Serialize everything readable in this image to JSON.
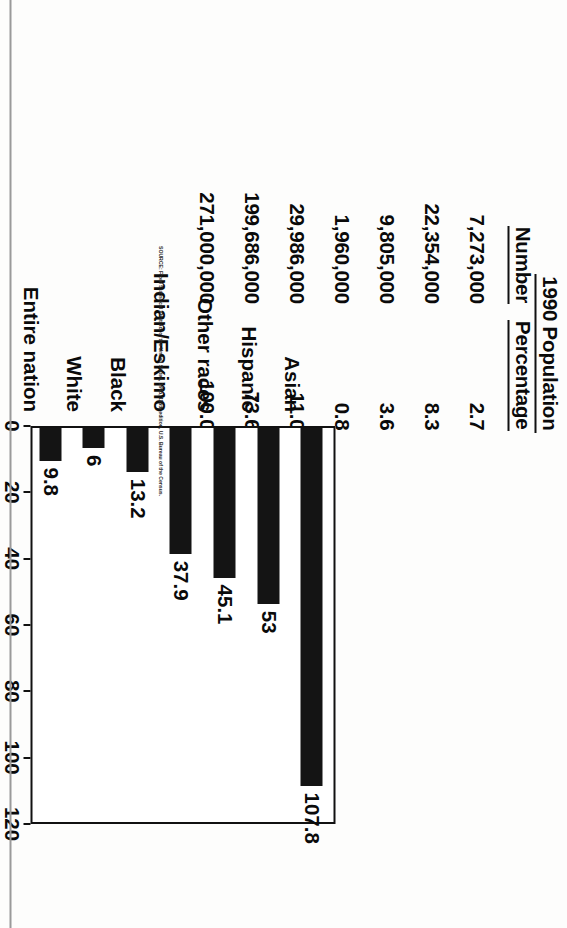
{
  "table": {
    "header_top": "1990 Population",
    "header_number": "Number",
    "header_percentage": "Percentage",
    "rows": [
      {
        "number": "7,273,000",
        "percentage": "2.7"
      },
      {
        "number": "22,354,000",
        "percentage": "8.3"
      },
      {
        "number": "9,805,000",
        "percentage": "3.6"
      },
      {
        "number": "1,960,000",
        "percentage": "0.8"
      },
      {
        "number": "29,986,000",
        "percentage": "11.0"
      },
      {
        "number": "199,686,000",
        "percentage": "73.6"
      },
      {
        "number": "271,000,000",
        "percentage": "100.0"
      }
    ]
  },
  "chart_data": {
    "type": "bar",
    "orientation": "horizontal",
    "title": "",
    "xlabel": "Percent increase 1980 to 1990",
    "ylabel": "",
    "xlim": [
      0,
      120
    ],
    "xticks": [
      0,
      20,
      40,
      60,
      80,
      100,
      120
    ],
    "grid": false,
    "legend": null,
    "categories": [
      "Asian",
      "Hispanic",
      "Other races",
      "Indian/Eskimo",
      "Black",
      "White",
      "Entire nation"
    ],
    "values": [
      107.8,
      53,
      45.1,
      37.9,
      13.2,
      6,
      9.8
    ],
    "value_labels": [
      "107.8",
      "53",
      "45.1",
      "37.9",
      "13.2",
      "6",
      "9.8"
    ],
    "bar_color": "#141414"
  },
  "source": {
    "text": "SOURCE: From Statistical Abstract of the United States, 1995, 115th edition, U.S. Bureau of the Census."
  }
}
